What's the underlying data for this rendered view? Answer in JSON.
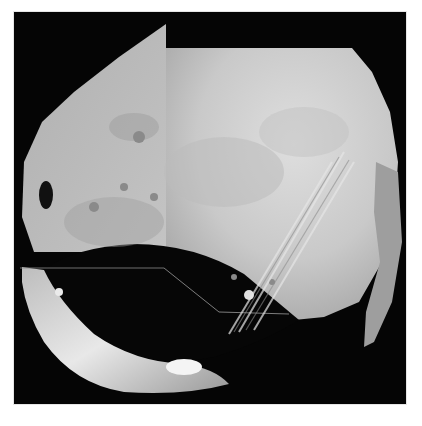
{
  "image": {
    "subject": "Phobos (moon of Mars) — grayscale spacecraft image mosaic",
    "alt": "Black-and-white mosaic photograph of Phobos showing grooves, craters, a large dark shadowed crater region at lower left, and visible tile seams",
    "colors": {
      "background": "#ffffff",
      "space": "#050505",
      "surface_light": "#d8d8d8",
      "surface_mid": "#b8b8b8",
      "surface_shadow": "#0a0a0a",
      "highlight": "#f2f2f2"
    }
  }
}
